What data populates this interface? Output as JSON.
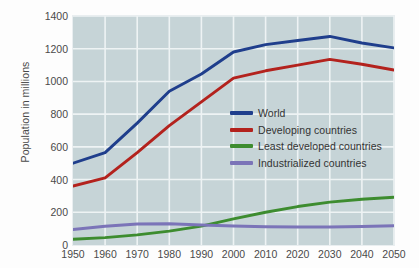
{
  "chart_data": {
    "type": "line",
    "title": "",
    "subtitle": "",
    "xlabel": "",
    "ylabel": "Population in millions",
    "x": [
      1950,
      1960,
      1970,
      1980,
      1990,
      2000,
      2010,
      2020,
      2030,
      2040,
      2050
    ],
    "xtick_labels": [
      "1950",
      "1960",
      "1970",
      "1980",
      "1990",
      "2000",
      "2010",
      "2020",
      "2030",
      "2040",
      "2050"
    ],
    "ytick_labels": [
      "1400",
      "1200",
      "1000",
      "800",
      "600",
      "400",
      "200",
      "0"
    ],
    "ytick_values": [
      1400,
      1200,
      1000,
      800,
      600,
      400,
      200,
      0
    ],
    "xlim": [
      1950,
      2050
    ],
    "ylim": [
      0,
      1400
    ],
    "grid": true,
    "legend_position": "center-right-inside",
    "plot_background": "#c6d4d7",
    "gridline_color": "#eef3f4",
    "series": [
      {
        "name": "World",
        "color": "#1f3e8c",
        "values": [
          500,
          565,
          745,
          940,
          1045,
          1180,
          1225,
          1250,
          1275,
          1235,
          1205
        ]
      },
      {
        "name": "Developing countries",
        "color": "#b3221d",
        "values": [
          360,
          410,
          565,
          730,
          875,
          1020,
          1065,
          1100,
          1135,
          1105,
          1070
        ]
      },
      {
        "name": "Least developed countries",
        "color": "#3d8c2f",
        "values": [
          35,
          45,
          62,
          85,
          115,
          160,
          200,
          235,
          262,
          280,
          292
        ]
      },
      {
        "name": "Industrialized countries",
        "color": "#7b74b8",
        "values": [
          95,
          115,
          128,
          130,
          122,
          116,
          112,
          110,
          110,
          113,
          118
        ]
      }
    ]
  }
}
